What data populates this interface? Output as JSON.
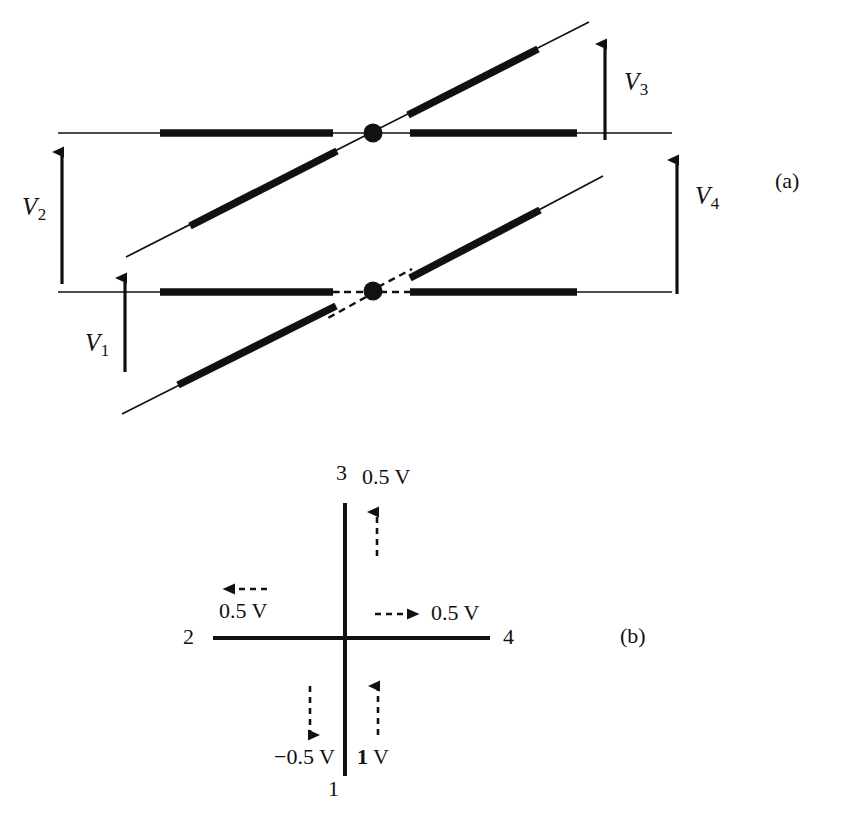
{
  "figure": {
    "panels": [
      {
        "id": "a",
        "label": "(a)",
        "description": "Two stacked waveguide crossings formed by a horizontal line and a diagonal line meeting at a node, with voltage arrows",
        "voltage_labels": [
          {
            "name": "V1",
            "base": "V",
            "subscript": "1"
          },
          {
            "name": "V2",
            "base": "V",
            "subscript": "2"
          },
          {
            "name": "V3",
            "base": "V",
            "subscript": "3"
          },
          {
            "name": "V4",
            "base": "V",
            "subscript": "4"
          }
        ]
      },
      {
        "id": "b",
        "label": "(b)",
        "description": "Four-port cross junction with port numbers and applied voltages",
        "ports": [
          {
            "id": "1",
            "label": "1",
            "position": "bottom"
          },
          {
            "id": "2",
            "label": "2",
            "position": "left"
          },
          {
            "id": "3",
            "label": "3",
            "position": "top"
          },
          {
            "id": "4",
            "label": "4",
            "position": "right"
          }
        ],
        "voltages": [
          {
            "id": "top",
            "label": "0.5 V",
            "direction": "up",
            "port": "3"
          },
          {
            "id": "left",
            "label": "0.5 V",
            "direction": "left",
            "port": "2"
          },
          {
            "id": "right",
            "label": "0.5 V",
            "direction": "right",
            "port": "4"
          },
          {
            "id": "bottom-left",
            "label": "−0.5 V",
            "direction": "down",
            "port": "1"
          },
          {
            "id": "bottom-right",
            "label_prefix": "1",
            "label_suffix": " V",
            "label": "1 V",
            "direction": "up",
            "port": "1"
          }
        ]
      }
    ],
    "colors": {
      "ink": "#111111",
      "background": "#ffffff",
      "faint_text": "#ececed"
    }
  }
}
